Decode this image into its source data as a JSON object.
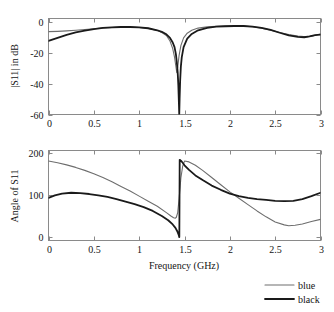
{
  "figure": {
    "background": "#ffffff",
    "axis_color": "#8a8a8a"
  },
  "legend": {
    "position": "bottom-right",
    "entries": [
      {
        "label": "blue",
        "color": "#6e6e6e",
        "width": 1.1
      },
      {
        "label": "black",
        "color": "#1a1a1a",
        "width": 1.8
      }
    ]
  },
  "chart_data": [
    {
      "type": "line",
      "id": "s11-magnitude",
      "title": "",
      "xlabel": "",
      "ylabel": "|S11| in dB",
      "xlim": [
        0,
        3
      ],
      "ylim": [
        -60,
        2
      ],
      "xticks": [
        0,
        0.5,
        1,
        1.5,
        2,
        2.5,
        3
      ],
      "xticklabels": [
        "0",
        "0.5",
        "1",
        "1.5",
        "2",
        "2.5",
        "3"
      ],
      "yticks": [
        0,
        -20,
        -40,
        -60
      ],
      "yticklabels": [
        "0",
        "-20",
        "-40",
        "-60"
      ],
      "grid": false,
      "legend": [
        "blue",
        "black"
      ],
      "series": [
        {
          "name": "blue",
          "color": "#6e6e6e",
          "width": 1.1,
          "x": [
            0,
            0.1,
            0.2,
            0.3,
            0.4,
            0.5,
            0.6,
            0.7,
            0.8,
            0.9,
            1.0,
            1.1,
            1.2,
            1.25,
            1.3,
            1.34,
            1.37,
            1.39,
            1.405,
            1.415,
            1.425,
            1.44,
            1.46,
            1.49,
            1.53,
            1.58,
            1.65,
            1.75,
            1.85,
            1.95,
            2.05,
            2.15,
            2.25,
            2.35,
            2.45,
            2.55,
            2.65,
            2.75,
            2.85,
            2.92,
            3.0
          ],
          "y": [
            -6.5,
            -6.3,
            -6.0,
            -5.6,
            -5.1,
            -4.6,
            -4.1,
            -3.8,
            -3.6,
            -3.6,
            -3.8,
            -4.4,
            -5.8,
            -7.0,
            -9.0,
            -12.5,
            -17.5,
            -23.0,
            -29.0,
            -33.0,
            -29.5,
            -22.0,
            -15.5,
            -10.5,
            -7.5,
            -5.6,
            -4.2,
            -3.4,
            -3.1,
            -2.9,
            -2.85,
            -2.9,
            -3.3,
            -4.2,
            -5.5,
            -7.0,
            -8.4,
            -9.4,
            -9.8,
            -9.2,
            -8.0
          ]
        },
        {
          "name": "black",
          "color": "#1a1a1a",
          "width": 1.8,
          "x": [
            0,
            0.1,
            0.2,
            0.3,
            0.4,
            0.5,
            0.6,
            0.7,
            0.8,
            0.9,
            1.0,
            1.1,
            1.2,
            1.25,
            1.3,
            1.34,
            1.37,
            1.39,
            1.405,
            1.415,
            1.425,
            1.432,
            1.438,
            1.442,
            1.446,
            1.452,
            1.46,
            1.47,
            1.49,
            1.53,
            1.58,
            1.65,
            1.75,
            1.85,
            1.95,
            2.05,
            2.15,
            2.25,
            2.35,
            2.45,
            2.55,
            2.65,
            2.75,
            2.82,
            2.88,
            2.94,
            3.0
          ],
          "y": [
            -12.5,
            -10.5,
            -8.6,
            -7.0,
            -5.8,
            -4.8,
            -4.1,
            -3.7,
            -3.5,
            -3.5,
            -3.7,
            -4.3,
            -5.6,
            -6.6,
            -8.2,
            -10.5,
            -13.5,
            -16.5,
            -21.0,
            -26.0,
            -33.0,
            -41.0,
            -52.0,
            -60.0,
            -50.0,
            -38.0,
            -29.0,
            -23.0,
            -16.5,
            -11.0,
            -8.0,
            -5.6,
            -4.0,
            -3.3,
            -3.0,
            -2.85,
            -2.85,
            -3.2,
            -4.0,
            -5.4,
            -7.2,
            -8.9,
            -9.9,
            -10.1,
            -9.6,
            -8.8,
            -8.4
          ]
        }
      ]
    },
    {
      "type": "line",
      "id": "s11-angle",
      "title": "",
      "xlabel": "Frequency (GHz)",
      "ylabel": "Angle of S11",
      "xlim": [
        0,
        3
      ],
      "ylim": [
        -8,
        205
      ],
      "xticks": [
        0,
        0.5,
        1,
        1.5,
        2,
        2.5,
        3
      ],
      "xticklabels": [
        "0",
        "0.5",
        "1",
        "1.5",
        "2",
        "2.5",
        "3"
      ],
      "yticks": [
        0,
        100,
        200
      ],
      "yticklabels": [
        "0",
        "100",
        "200"
      ],
      "grid": false,
      "legend": [
        "blue",
        "black"
      ],
      "series": [
        {
          "name": "blue",
          "color": "#6e6e6e",
          "width": 1.1,
          "x": [
            0,
            0.1,
            0.2,
            0.3,
            0.4,
            0.5,
            0.6,
            0.7,
            0.8,
            0.9,
            1.0,
            1.1,
            1.2,
            1.3,
            1.35,
            1.38,
            1.4,
            1.41,
            1.425,
            1.44,
            1.46,
            1.48,
            1.5,
            1.55,
            1.62,
            1.7,
            1.8,
            1.9,
            2.0,
            2.1,
            2.2,
            2.3,
            2.4,
            2.5,
            2.6,
            2.65,
            2.72,
            2.8,
            2.9,
            3.0
          ],
          "y": [
            180,
            176,
            171,
            165,
            158,
            150,
            141,
            131,
            120,
            109,
            97,
            85,
            73,
            58,
            50,
            46,
            45,
            47,
            58,
            90,
            140,
            168,
            180,
            178,
            170,
            158,
            141,
            124,
            107,
            92,
            77,
            62,
            48,
            36,
            29,
            27,
            28,
            31,
            37,
            42
          ]
        },
        {
          "name": "black",
          "color": "#1a1a1a",
          "width": 1.8,
          "x": [
            0,
            0.07,
            0.15,
            0.25,
            0.35,
            0.45,
            0.55,
            0.65,
            0.75,
            0.85,
            0.95,
            1.05,
            1.15,
            1.25,
            1.32,
            1.37,
            1.4,
            1.42,
            1.435,
            1.44,
            1.443,
            1.447,
            1.46,
            1.48,
            1.5,
            1.55,
            1.62,
            1.7,
            1.8,
            1.9,
            2.0,
            2.1,
            2.2,
            2.3,
            2.4,
            2.5,
            2.6,
            2.7,
            2.8,
            2.9,
            3.0
          ],
          "y": [
            93,
            99,
            103,
            105,
            104,
            102,
            99,
            95,
            90,
            84,
            78,
            71,
            62,
            50,
            40,
            30,
            22,
            14,
            6,
            2,
            0,
            183,
            181,
            176,
            170,
            159,
            146,
            135,
            122,
            112,
            103,
            97,
            93,
            90,
            88,
            86,
            85,
            86,
            90,
            97,
            105
          ]
        }
      ]
    }
  ]
}
